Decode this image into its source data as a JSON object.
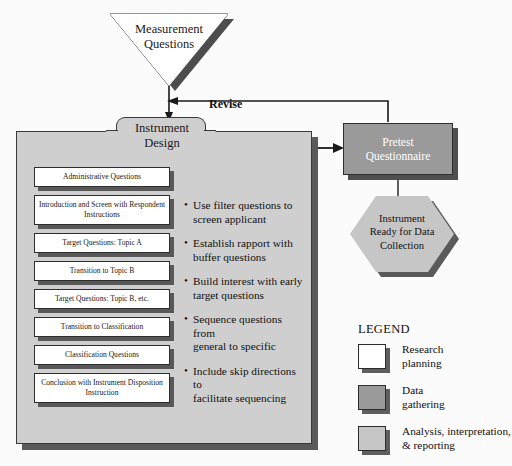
{
  "colors": {
    "background": "#fbfbfb",
    "folder_fill": "#cfcfcf",
    "box_white": "#ffffff",
    "data_gathering_gray": "#9a9a9a",
    "analysis_gray": "#c6c6c6",
    "shadow": "#555555",
    "outline": "#2e2e2e"
  },
  "start": {
    "shape": "inverted-triangle",
    "label": "Measurement Questions",
    "line1": "Measurement",
    "line2": "Questions"
  },
  "feedback": {
    "label": "Revise"
  },
  "instrument_design": {
    "title": "Instrument Design",
    "title_line1": "Instrument",
    "title_line2": "Design",
    "question_boxes": [
      {
        "label": "Administrative Questions",
        "lines": [
          "Administrative Questions"
        ]
      },
      {
        "label": "Introduction and Screen with Respondent Instructions",
        "lines": [
          "Introduction and Screen with",
          "Respondent Instructions"
        ]
      },
      {
        "label": "Target Questions: Topic A",
        "lines": [
          "Target Questions: Topic A"
        ]
      },
      {
        "label": "Transition to Topic B",
        "lines": [
          "Transition to Topic B"
        ]
      },
      {
        "label": "Target Questions: Topic B, etc.",
        "lines": [
          "Target Questions: Topic B, etc."
        ]
      },
      {
        "label": "Transition to Classification",
        "lines": [
          "Transition to Classification"
        ]
      },
      {
        "label": "Classification Questions",
        "lines": [
          "Classification Questions"
        ]
      },
      {
        "label": "Conclusion with Instrument Disposition Instruction",
        "lines": [
          "Conclusion with Instrument",
          "Disposition Instruction"
        ]
      }
    ],
    "guidelines": [
      {
        "line1": "Use filter questions to",
        "line2": "screen applicant"
      },
      {
        "line1": "Establish rapport with",
        "line2": "buffer questions"
      },
      {
        "line1": "Build interest with early",
        "line2": "target questions"
      },
      {
        "line1": "Sequence questions from",
        "line2": "general to specific"
      },
      {
        "line1": "Include skip directions to",
        "line2": "facilitate sequencing"
      }
    ]
  },
  "pretest": {
    "title": "Pretest Questionnaire",
    "line1": "Pretest",
    "line2": "Questionnaire"
  },
  "outcome": {
    "shape": "hexagon",
    "title": "Instrument Ready for Data Collection",
    "line1": "Instrument",
    "line2": "Ready for Data",
    "line3": "Collection"
  },
  "legend": {
    "title": "LEGEND",
    "items": [
      {
        "swatch_color": "#ffffff",
        "line1": "Research",
        "line2": "planning",
        "label": "Research planning"
      },
      {
        "swatch_color": "#9a9a9a",
        "line1": "Data",
        "line2": "gathering",
        "label": "Data gathering"
      },
      {
        "swatch_color": "#c6c6c6",
        "line1": "Analysis, interpretation,",
        "line2": "& reporting",
        "label": "Analysis, interpretation, & reporting"
      }
    ]
  }
}
